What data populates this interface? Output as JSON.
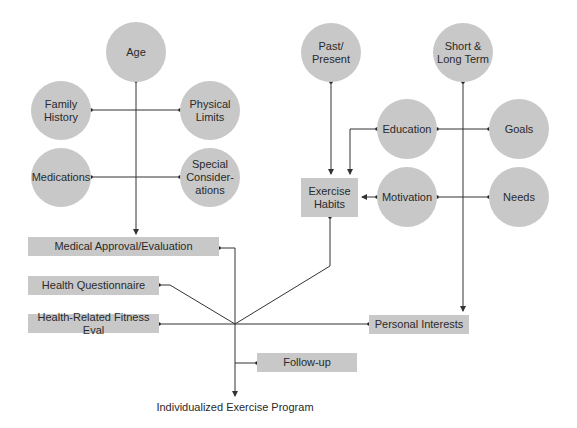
{
  "diagram": {
    "left_cluster": {
      "age": "Age",
      "family_history": "Family\nHistory",
      "physical_limits": "Physical\nLimits",
      "medications": "Medications",
      "special_considerations": "Special\nConsider-\nations"
    },
    "right_cluster": {
      "past_present": "Past/\nPresent",
      "short_long_term": "Short &\nLong Term",
      "education": "Education",
      "goals": "Goals",
      "motivation": "Motivation",
      "needs": "Needs",
      "exercise_habits": "Exercise\nHabits"
    },
    "bars": {
      "medical_approval": "Medical Approval/Evaluation",
      "health_questionnaire": "Health Questionnaire",
      "health_fitness_eval": "Health-Related Fitness Eval",
      "personal_interests": "Personal Interests",
      "follow_up": "Follow-up"
    },
    "output_label": "Individualized Exercise Program",
    "colors": {
      "node_fill": "#c8c8c8",
      "line": "#333333",
      "background": "#ffffff"
    }
  }
}
